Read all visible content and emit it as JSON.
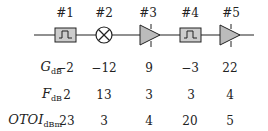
{
  "stages": [
    {
      "label": "#1",
      "type": "filter",
      "x": 64
    },
    {
      "label": "#2",
      "type": "mixer",
      "x": 104
    },
    {
      "label": "#3",
      "type": "amplifier",
      "x": 148
    },
    {
      "label": "#4",
      "type": "filter",
      "x": 190
    },
    {
      "label": "#5",
      "type": "amplifier",
      "x": 230
    }
  ],
  "rows": [
    {
      "name": "G",
      "subscript": "dB",
      "values": [
        "−2",
        "−12",
        "9",
        "−3",
        "22"
      ]
    },
    {
      "name": "F",
      "subscript": "dB",
      "values": [
        "2",
        "13",
        "3",
        "3",
        "4"
      ]
    },
    {
      "name": "OTOI",
      "subscript": "dBm",
      "values": [
        "23",
        "3",
        "4",
        "20",
        "5"
      ]
    }
  ],
  "colors": {
    "block_fill": "#cccccc",
    "stroke": "#222222"
  }
}
